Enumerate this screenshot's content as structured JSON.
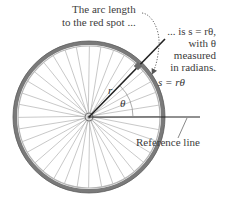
{
  "figure": {
    "width": 230,
    "height": 205,
    "wheel": {
      "center_x": 89,
      "center_y": 117,
      "radius": 75,
      "spoke_count": 36,
      "tire_color": "#6e6e6e",
      "rim_color": "#9a9a9a",
      "spoke_color": "#b0b0b0"
    },
    "radius_line": {
      "angle_deg": 45,
      "color": "#222222"
    },
    "reference_line": {
      "color": "#222222"
    },
    "red_spot_color": "#7a7a7a"
  },
  "annotations": {
    "arc_length_line1": "The arc length",
    "arc_length_line2": "to the red spot ...",
    "formula_line1": "... is s = rθ,",
    "formula_line2": "with θ",
    "formula_line3": "measured",
    "formula_line4": "in radians.",
    "arc_formula": "s = rθ",
    "radius_symbol": "r",
    "angle_symbol": "θ",
    "reference_line_label": "Reference line"
  }
}
